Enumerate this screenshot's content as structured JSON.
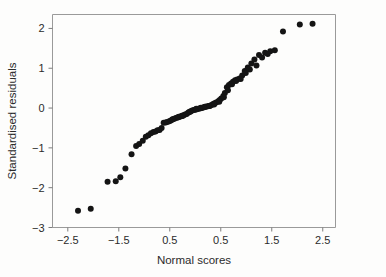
{
  "chart_data": {
    "type": "scatter",
    "title": "",
    "xlabel": "Normal scores",
    "ylabel": "Standardised residuals",
    "xlim": [
      -2.8,
      2.75
    ],
    "ylim": [
      -3.0,
      2.35
    ],
    "grid": false,
    "legend": null,
    "xticks": [
      -2.5,
      -1.5,
      -0.5,
      0.5,
      1.5,
      2.5
    ],
    "xticklabels": [
      "−2.5",
      "−1.5",
      "0.5",
      "0.5",
      "1.5",
      "2.5"
    ],
    "yticks": [
      -3,
      -2,
      -1,
      0,
      1,
      2
    ],
    "yticklabels": [
      "−3",
      "−2",
      "−1",
      "0",
      "1",
      "2"
    ],
    "marker": "circle",
    "marker_color": "#141414",
    "marker_size": 3.0,
    "frame_color": "#9a9a9a",
    "background_color": "#fdfdfc",
    "n_points": 97,
    "x": [
      -2.3,
      -2.05,
      -1.72,
      -1.56,
      -1.47,
      -1.37,
      -1.25,
      -1.16,
      -1.1,
      -1.03,
      -0.97,
      -0.92,
      -0.87,
      -0.82,
      -0.78,
      -0.74,
      -0.7,
      -0.66,
      -0.62,
      -0.58,
      -0.55,
      -0.51,
      -0.48,
      -0.45,
      -0.41,
      -0.38,
      -0.35,
      -0.32,
      -0.29,
      -0.26,
      -0.23,
      -0.2,
      -0.17,
      -0.14,
      -0.12,
      -0.09,
      -0.06,
      -0.03,
      0.0,
      0.03,
      0.06,
      0.09,
      0.12,
      0.14,
      0.17,
      0.2,
      0.23,
      0.26,
      0.29,
      0.32,
      0.35,
      0.38,
      0.41,
      0.45,
      0.48,
      0.51,
      0.55,
      0.58,
      0.62,
      0.66,
      0.7,
      0.74,
      0.78,
      0.82,
      0.87,
      0.92,
      0.97,
      1.03,
      1.1,
      1.16,
      1.25,
      1.37,
      1.47,
      1.56,
      1.72,
      2.05,
      2.3,
      -0.44,
      -0.33,
      -0.25,
      -0.1,
      0.02,
      0.11,
      0.19,
      0.28,
      0.37,
      0.47,
      0.56,
      0.64,
      0.72,
      0.8,
      0.89,
      0.99,
      1.07,
      1.2,
      1.31,
      1.42
    ],
    "y": [
      -2.58,
      -2.53,
      -1.85,
      -1.84,
      -1.74,
      -1.52,
      -1.16,
      -0.95,
      -0.9,
      -0.82,
      -0.72,
      -0.68,
      -0.63,
      -0.6,
      -0.59,
      -0.56,
      -0.55,
      -0.5,
      -0.37,
      -0.36,
      -0.35,
      -0.33,
      -0.31,
      -0.29,
      -0.27,
      -0.25,
      -0.24,
      -0.22,
      -0.21,
      -0.19,
      -0.18,
      -0.16,
      -0.15,
      -0.12,
      -0.1,
      -0.08,
      -0.06,
      -0.05,
      -0.04,
      -0.03,
      -0.02,
      -0.01,
      0.0,
      0.01,
      0.02,
      0.03,
      0.04,
      0.05,
      0.06,
      0.08,
      0.1,
      0.12,
      0.14,
      0.17,
      0.2,
      0.24,
      0.3,
      0.38,
      0.52,
      0.58,
      0.62,
      0.66,
      0.7,
      0.72,
      0.74,
      0.82,
      0.93,
      1.02,
      1.12,
      1.22,
      1.33,
      1.39,
      1.43,
      1.45,
      1.92,
      2.1,
      2.12,
      -0.28,
      -0.23,
      -0.2,
      -0.09,
      -0.02,
      0.01,
      0.03,
      0.05,
      0.09,
      0.16,
      0.27,
      0.45,
      0.6,
      0.68,
      0.73,
      0.88,
      0.97,
      1.07,
      1.27,
      1.36,
      1.44
    ]
  },
  "axes": {
    "x_title": "Normal scores",
    "y_title": "Standardised residuals"
  }
}
